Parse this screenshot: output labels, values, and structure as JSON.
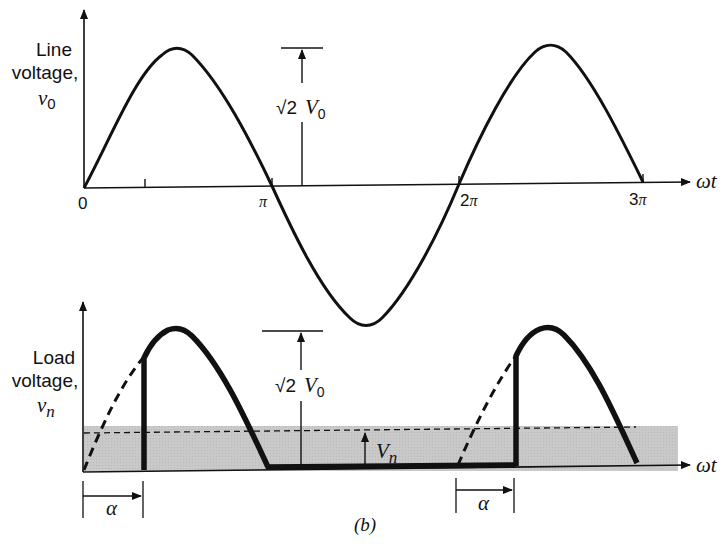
{
  "figure_label": "(b)",
  "top_panel": {
    "ylabel_line1": "Line",
    "ylabel_line2": "voltage,",
    "ylabel_symbol": "v",
    "ylabel_subscript": "0",
    "xlabel": "ωt",
    "ticks": {
      "zero": "0",
      "pi": "π",
      "two_pi_num": "2",
      "two_pi_sym": "π",
      "three_pi_num": "3",
      "three_pi_sym": "π"
    },
    "amplitude_label": "√2",
    "amplitude_symbol": "V",
    "amplitude_subscript": "0"
  },
  "bottom_panel": {
    "ylabel_line1": "Load",
    "ylabel_line2": "voltage,",
    "ylabel_symbol": "v",
    "ylabel_subscript": "n",
    "xlabel": "ωt",
    "amplitude_label": "√2",
    "amplitude_symbol": "V",
    "amplitude_subscript": "0",
    "average_symbol": "V",
    "average_subscript": "n",
    "firing_angle_label_1": "α",
    "firing_angle_label_2": "α"
  },
  "colors": {
    "ink": "#111111",
    "shade": "#c8c8c8",
    "background": "#ffffff"
  }
}
